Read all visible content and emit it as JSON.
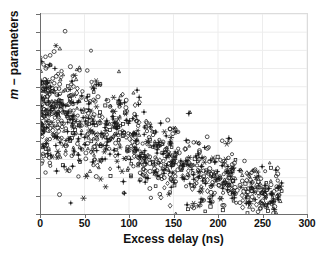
{
  "chart_data": {
    "type": "scatter",
    "title": "",
    "xlabel": "Excess delay (ns)",
    "ylabel": "m − parameters",
    "ylabel_italic_prefix": "m",
    "ylabel_rest": " − parameters",
    "xlim": [
      0,
      300
    ],
    "ylim": [
      0.5,
      6
    ],
    "xticks": [
      0,
      50,
      100,
      150,
      200,
      250,
      300
    ],
    "xticklabels": [
      "0",
      "50",
      "100",
      "150",
      "200",
      "250",
      "300"
    ],
    "yticks": [
      0.5,
      1,
      1.5,
      2,
      2.5,
      3,
      3.5,
      4,
      4.5,
      5,
      5.5,
      6
    ],
    "yticklabels": [
      "0.5",
      "1",
      "1.5",
      "2",
      "2.5",
      "3",
      "3.5",
      "4",
      "4.5",
      "5",
      "5.5",
      "6"
    ],
    "grid": true,
    "grid_color": "#ededed",
    "legend": "none",
    "marker_color": "#1a1a1a",
    "background": "#ffffff",
    "n_points": 1100,
    "marker_styles": [
      {
        "name": "circle",
        "glyph": "open-circle",
        "share": 0.34
      },
      {
        "name": "triangle",
        "glyph": "open-triangle-up",
        "share": 0.12
      },
      {
        "name": "square",
        "glyph": "open-square",
        "share": 0.1
      },
      {
        "name": "plus",
        "glyph": "plus-filled",
        "share": 0.22
      },
      {
        "name": "star",
        "glyph": "six-point-star",
        "share": 0.12
      },
      {
        "name": "diamond",
        "glyph": "open-diamond",
        "share": 0.1
      }
    ],
    "trend": {
      "shape": "monotonic-decreasing",
      "anchor_points": [
        {
          "x": 0,
          "y": 3.4
        },
        {
          "x": 50,
          "y": 3.05
        },
        {
          "x": 100,
          "y": 2.6
        },
        {
          "x": 150,
          "y": 1.95
        },
        {
          "x": 200,
          "y": 1.35
        },
        {
          "x": 250,
          "y": 1.05
        },
        {
          "x": 270,
          "y": 0.95
        }
      ],
      "spread_at_x0": 1.25,
      "spread_at_xmax": 0.55
    },
    "density_envelope": {
      "x_max_observed": 272,
      "y_max_observed": 5.85,
      "y_min_observed": 0.5,
      "core_x_range": [
        0,
        160
      ],
      "core_y_range": [
        1.8,
        4.3
      ]
    }
  }
}
